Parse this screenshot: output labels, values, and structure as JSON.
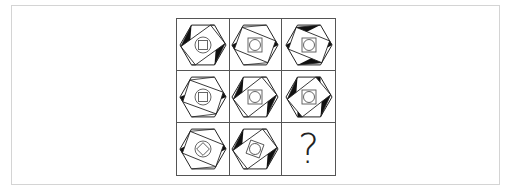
{
  "puzzle": {
    "title": "3x3 figure reasoning matrix",
    "missing_symbol": "?",
    "cells": [
      {
        "row": 1,
        "col": 1,
        "rot": -28,
        "center": "square-in-circle",
        "inner_rot": 0,
        "black": [
          0,
          2
        ]
      },
      {
        "row": 1,
        "col": 2,
        "rot": 30,
        "center": "circle-in-square",
        "inner_rot": 0,
        "black": [
          1,
          3
        ]
      },
      {
        "row": 1,
        "col": 3,
        "rot": 30,
        "center": "circle-in-square",
        "inner_rot": 0,
        "black": [
          0,
          1,
          2,
          3
        ]
      },
      {
        "row": 2,
        "col": 1,
        "rot": 28,
        "center": "square-in-circle",
        "inner_rot": 0,
        "black": [
          1,
          3
        ]
      },
      {
        "row": 2,
        "col": 2,
        "rot": -30,
        "center": "circle-in-square",
        "inner_rot": 0,
        "black": [
          0,
          2
        ]
      },
      {
        "row": 2,
        "col": 3,
        "rot": -30,
        "center": "circle-in-square",
        "inner_rot": 0,
        "black": [
          0,
          1,
          2,
          3
        ]
      },
      {
        "row": 3,
        "col": 1,
        "rot": 30,
        "center": "square-in-circle",
        "inner_rot": 45,
        "black": [
          1,
          3
        ]
      },
      {
        "row": 3,
        "col": 2,
        "rot": -28,
        "center": "circle-in-square",
        "inner_rot": 20,
        "black": [
          0,
          2
        ]
      },
      {
        "row": 3,
        "col": 3,
        "missing": true
      }
    ]
  },
  "colors": {
    "line": "#222222",
    "fill": "#111111",
    "grid": "#555555",
    "card_border": "#d4d4d4"
  }
}
